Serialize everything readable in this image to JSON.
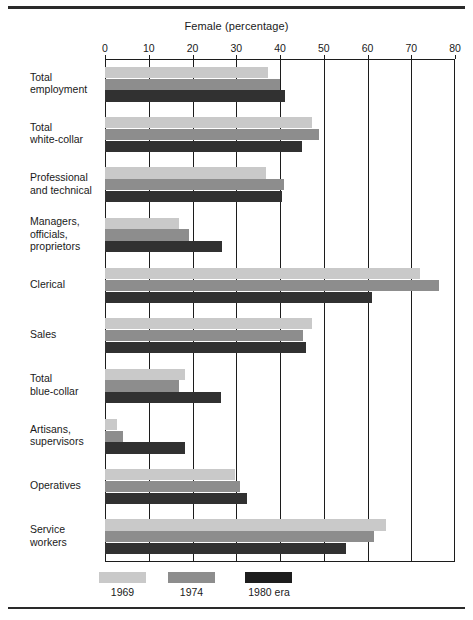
{
  "chart_data": {
    "type": "bar",
    "orientation": "horizontal",
    "title": "Female (percentage)",
    "xlabel": "Female (percentage)",
    "ylabel": "",
    "xlim": [
      0,
      80
    ],
    "xticks": [
      0,
      10,
      20,
      30,
      40,
      50,
      60,
      70,
      80
    ],
    "xtick_labels": [
      "0",
      "10",
      "20",
      "30",
      "40",
      "50",
      "60",
      "70",
      "80"
    ],
    "grid": true,
    "grid_axis": "x",
    "legend_position": "bottom",
    "categories": [
      "Total employment",
      "Total white-collar",
      "Professional and technical",
      "Managers, officials, proprietors",
      "Clerical",
      "Sales",
      "Total blue-collar",
      "Artisans, supervisors",
      "Operatives",
      "Service workers"
    ],
    "category_label_lines": [
      [
        "Total",
        "employment"
      ],
      [
        "Total",
        "white-collar"
      ],
      [
        "Professional",
        "and technical"
      ],
      [
        "Managers,",
        "officials,",
        "proprietors"
      ],
      [
        "Clerical"
      ],
      [
        "Sales"
      ],
      [
        "Total",
        "blue-collar"
      ],
      [
        "Artisans,",
        "supervisors"
      ],
      [
        "Operatives"
      ],
      [
        "Service",
        "workers"
      ]
    ],
    "series": [
      {
        "name": "1969",
        "color": "#c9c9c9",
        "values": [
          37.2,
          47.4,
          36.8,
          17.0,
          71.9,
          47.4,
          18.2,
          2.7,
          29.6,
          64.3
        ]
      },
      {
        "name": "1974",
        "color": "#8d8d8d",
        "values": [
          40.0,
          48.8,
          40.8,
          19.3,
          76.3,
          45.3,
          17.0,
          4.0,
          30.8,
          61.5
        ]
      },
      {
        "name": "1980 era",
        "color": "#313131",
        "values": [
          41.1,
          45.1,
          40.4,
          26.7,
          61.1,
          45.9,
          26.4,
          18.2,
          32.4,
          55.1
        ]
      }
    ]
  },
  "legend": {
    "items": [
      {
        "label": "1969",
        "color": "#c9c9c9"
      },
      {
        "label": "1974",
        "color": "#8d8d8d"
      },
      {
        "label": "1980 era",
        "color": "#1d1d1d"
      }
    ]
  }
}
